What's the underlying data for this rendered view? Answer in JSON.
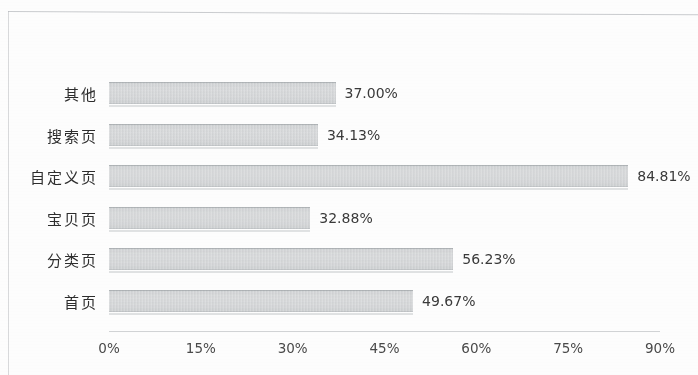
{
  "chart_data": {
    "type": "bar",
    "orientation": "horizontal",
    "title": "",
    "subtitle": "",
    "xlabel": "",
    "ylabel": "",
    "categories": [
      "其他",
      "搜索页",
      "自定义页",
      "宝贝页",
      "分类页",
      "首页"
    ],
    "values": [
      37.0,
      34.13,
      84.81,
      32.88,
      56.23,
      49.67
    ],
    "value_labels": [
      "37.00%",
      "34.13%",
      "84.81%",
      "32.88%",
      "56.23%",
      "49.67%"
    ],
    "xlim": [
      0,
      90
    ],
    "xticks": [
      0,
      15,
      30,
      45,
      60,
      75,
      90
    ],
    "xtick_labels": [
      "0%",
      "15%",
      "30%",
      "45%",
      "60%",
      "75%",
      "90%"
    ],
    "grid": false,
    "legend": null,
    "bar_color": "#d6d8da",
    "axis_color": "#d2d4d6",
    "text_color": "#3a3a3a"
  },
  "bars": [
    {
      "category": "其他",
      "value": 37.0,
      "label": "37.00%"
    },
    {
      "category": "搜索页",
      "value": 34.13,
      "label": "34.13%"
    },
    {
      "category": "自定义页",
      "value": 84.81,
      "label": "84.81%"
    },
    {
      "category": "宝贝页",
      "value": 32.88,
      "label": "32.88%"
    },
    {
      "category": "分类页",
      "value": 56.23,
      "label": "56.23%"
    },
    {
      "category": "首页",
      "value": 49.67,
      "label": "49.67%"
    }
  ],
  "xticks": [
    {
      "label": "0%",
      "value": 0
    },
    {
      "label": "15%",
      "value": 15
    },
    {
      "label": "30%",
      "value": 30
    },
    {
      "label": "45%",
      "value": 45
    },
    {
      "label": "60%",
      "value": 60
    },
    {
      "label": "75%",
      "value": 75
    },
    {
      "label": "90%",
      "value": 90
    }
  ]
}
